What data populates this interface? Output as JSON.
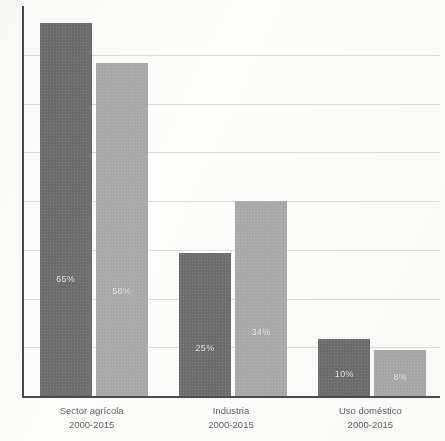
{
  "chart_data": {
    "type": "bar",
    "title": "",
    "subtitle": "",
    "xlabel": "",
    "ylabel": "",
    "categories": [
      "Sector agrícola",
      "Industria",
      "Uso doméstico"
    ],
    "category_periods": [
      "2000-2015",
      "2000-2015",
      "2000-2015"
    ],
    "series": [
      {
        "name": "Serie 1",
        "color": "#6d6d6d",
        "values": [
          65,
          25,
          10
        ],
        "value_labels": [
          "65%",
          "25%",
          "10%"
        ]
      },
      {
        "name": "Serie 2",
        "color": "#a9a9a9",
        "values": [
          58,
          34,
          8
        ],
        "value_labels": [
          "58%",
          "34%",
          "8%"
        ]
      }
    ],
    "ylim": [
      0,
      68
    ],
    "ytick_labels": [],
    "grid": true,
    "gridline_count": 7,
    "legend": "none",
    "legend_position": "none",
    "annotations": []
  },
  "axes": {
    "y_axis_color": "#4a4a4a",
    "x_axis_color": "#4a4a4a",
    "gridline_color": "#d8d6d2"
  },
  "canvas": {
    "background": "#fdfdfc"
  }
}
